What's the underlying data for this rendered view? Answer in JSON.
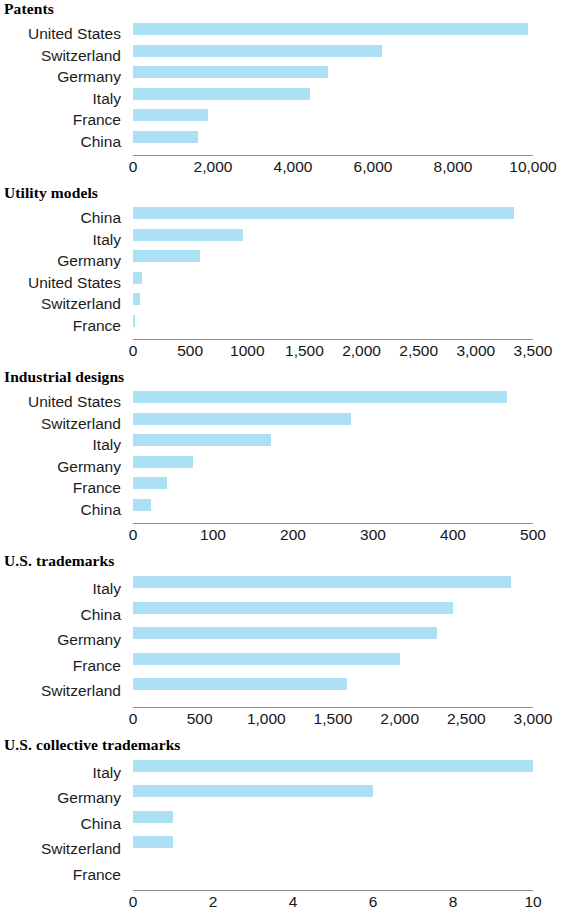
{
  "figure": {
    "bar_color": "#ace1f5",
    "axis_color": "#8f8f8f",
    "text_color": "#1c1c1c"
  },
  "chart_data": [
    {
      "type": "bar",
      "orientation": "horizontal",
      "title": "Patents",
      "xlabel": "",
      "ylabel": "",
      "xlim": [
        0,
        10000
      ],
      "grid": false,
      "legend": "none",
      "tick_values": [
        0,
        2000,
        4000,
        6000,
        8000,
        10000
      ],
      "tick_labels": [
        "0",
        "2,000",
        "4,000",
        "6,000",
        "8,000",
        "10,000"
      ],
      "categories": [
        "United States",
        "Switzerland",
        "Germany",
        "Italy",
        "France",
        "China"
      ],
      "values": [
        9875,
        6230,
        4880,
        4430,
        1875,
        1625
      ]
    },
    {
      "type": "bar",
      "orientation": "horizontal",
      "title": "Utility models",
      "xlabel": "",
      "ylabel": "",
      "xlim": [
        0,
        3500
      ],
      "grid": false,
      "legend": "none",
      "tick_values": [
        0,
        500,
        1000,
        1500,
        2000,
        2500,
        3000,
        3500
      ],
      "tick_labels": [
        "0",
        "500",
        "1000",
        "1,500",
        "2,000",
        "2,500",
        "3,000",
        "3,500"
      ],
      "categories": [
        "China",
        "Italy",
        "Germany",
        "United States",
        "Switzerland",
        "France"
      ],
      "values": [
        3330,
        960,
        590,
        80,
        60,
        10
      ]
    },
    {
      "type": "bar",
      "orientation": "horizontal",
      "title": "Industrial designs",
      "xlabel": "",
      "ylabel": "",
      "xlim": [
        0,
        500
      ],
      "grid": false,
      "legend": "none",
      "tick_values": [
        0,
        100,
        200,
        300,
        400,
        500
      ],
      "tick_labels": [
        "0",
        "100",
        "200",
        "300",
        "400",
        "500"
      ],
      "categories": [
        "United States",
        "Switzerland",
        "Italy",
        "Germany",
        "France",
        "China"
      ],
      "values": [
        467,
        272,
        172,
        75,
        43,
        22
      ]
    },
    {
      "type": "bar",
      "orientation": "horizontal",
      "title": "U.S. trademarks",
      "xlabel": "",
      "ylabel": "",
      "xlim": [
        0,
        3000
      ],
      "grid": false,
      "legend": "none",
      "tick_values": [
        0,
        500,
        1000,
        1500,
        2000,
        2500,
        3000
      ],
      "tick_labels": [
        "0",
        "500",
        "1,000",
        "1,500",
        "2,000",
        "2,500",
        "3,000"
      ],
      "categories": [
        "Italy",
        "China",
        "Germany",
        "France",
        "Switzerland"
      ],
      "values": [
        2835,
        2400,
        2280,
        2000,
        1605
      ]
    },
    {
      "type": "bar",
      "orientation": "horizontal",
      "title": "U.S. collective trademarks",
      "xlabel": "",
      "ylabel": "",
      "xlim": [
        0,
        10
      ],
      "grid": false,
      "legend": "none",
      "tick_values": [
        0,
        2,
        4,
        6,
        8,
        10
      ],
      "tick_labels": [
        "0",
        "2",
        "4",
        "6",
        "8",
        "10"
      ],
      "categories": [
        "Italy",
        "Germany",
        "China",
        "Switzerland",
        "France"
      ],
      "values": [
        10,
        6,
        1,
        1,
        0
      ]
    }
  ]
}
